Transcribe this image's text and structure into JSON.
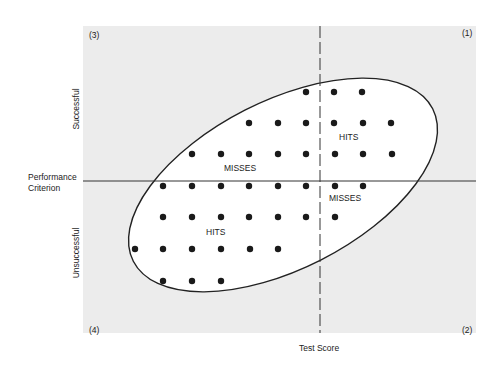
{
  "diagram": {
    "quadrants": {
      "q1": "(1)",
      "q2": "(2)",
      "q3": "(3)",
      "q4": "(4)"
    },
    "y_axis": {
      "top_label": "Successful",
      "bottom_label": "Unsuccessful",
      "cutoff_label_line1": "Performance",
      "cutoff_label_line2": "Criterion"
    },
    "x_axis": {
      "label": "Test Score"
    },
    "regions": {
      "hits_upper": "HITS",
      "misses_upper": "MISSES",
      "misses_lower": "MISSES",
      "hits_lower": "HITS"
    },
    "colors": {
      "background": "#ececec",
      "ellipse_fill": "#ffffff",
      "ink": "#222222"
    }
  },
  "chart_data": {
    "type": "scatter",
    "title": "",
    "xlabel": "Test Score",
    "ylabel": "Performance Criterion (Unsuccessful → Successful)",
    "x_cutoff_px": 320,
    "y_cutoff_px": 181,
    "points": [
      [
        306,
        92
      ],
      [
        334,
        92
      ],
      [
        362,
        92
      ],
      [
        249,
        123
      ],
      [
        278,
        123
      ],
      [
        306,
        123
      ],
      [
        334,
        123
      ],
      [
        363,
        123
      ],
      [
        391,
        123
      ],
      [
        192,
        154
      ],
      [
        221,
        154
      ],
      [
        249,
        154
      ],
      [
        278,
        154
      ],
      [
        306,
        154
      ],
      [
        335,
        154
      ],
      [
        363,
        154
      ],
      [
        392,
        154
      ],
      [
        163,
        186
      ],
      [
        192,
        186
      ],
      [
        221,
        186
      ],
      [
        249,
        186
      ],
      [
        278,
        186
      ],
      [
        306,
        186
      ],
      [
        335,
        186
      ],
      [
        363,
        186
      ],
      [
        163,
        217
      ],
      [
        192,
        217
      ],
      [
        221,
        217
      ],
      [
        249,
        217
      ],
      [
        278,
        217
      ],
      [
        306,
        217
      ],
      [
        335,
        217
      ],
      [
        135,
        249
      ],
      [
        163,
        249
      ],
      [
        192,
        249
      ],
      [
        221,
        249
      ],
      [
        250,
        249
      ],
      [
        278,
        249
      ],
      [
        163,
        281
      ],
      [
        192,
        281
      ],
      [
        221,
        281
      ]
    ],
    "annotations": [
      "HITS (quadrant 1)",
      "MISSES (quadrant 3)",
      "MISSES (quadrant 2)",
      "HITS (quadrant 4)"
    ]
  }
}
